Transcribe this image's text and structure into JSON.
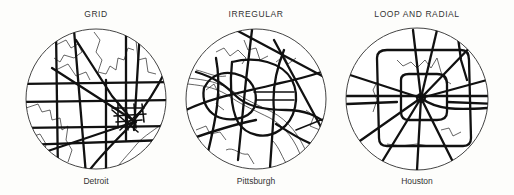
{
  "figure": {
    "panels": [
      {
        "pattern": "GRID",
        "city": "Detroit"
      },
      {
        "pattern": "IRREGULAR",
        "city": "Pittsburgh"
      },
      {
        "pattern": "LOOP AND RADIAL",
        "city": "Houston"
      }
    ]
  }
}
